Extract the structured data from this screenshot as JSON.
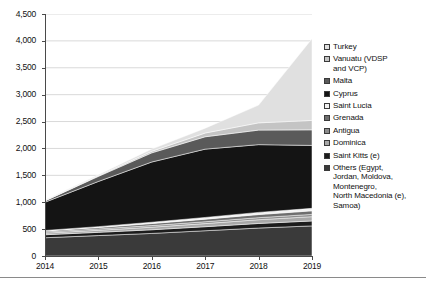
{
  "chart_data": {
    "type": "area",
    "stacked": true,
    "title": "",
    "xlabel": "",
    "ylabel": "",
    "x": [
      "2014",
      "2015",
      "2016",
      "2017",
      "2018",
      "2019"
    ],
    "categories": [
      "2014",
      "2015",
      "2016",
      "2017",
      "2018",
      "2019"
    ],
    "ylim": [
      0,
      4500
    ],
    "ytick_values": [
      0,
      500,
      1000,
      1500,
      2000,
      2500,
      3000,
      3500,
      4000,
      4500
    ],
    "ytick_labels": [
      "0",
      "500",
      "1,000",
      "1,500",
      "2,000",
      "2,500",
      "3,000",
      "3,500",
      "4,000",
      "4,500"
    ],
    "xtick_labels": [
      "2014",
      "2015",
      "2016",
      "2017",
      "2018",
      "2019"
    ],
    "grid": true,
    "grid_axis": "y",
    "legend_position": "right",
    "stack_order_bottom_to_top": [
      "Others (Egypt, Jordan, Moldova, Montenegro, North Macedonia (e), Samoa)",
      "Saint Kitts (e)",
      "Dominica",
      "Antigua",
      "Grenada",
      "Saint Lucia",
      "Cyprus",
      "Malta",
      "Vanuatu (VDSP and VCP)",
      "Turkey"
    ],
    "series": [
      {
        "name": "Others (Egypt, Jordan, Moldova, Montenegro, North Macedonia (e), Samoa)",
        "color": "#3a3a3a",
        "values": [
          340,
          380,
          420,
          470,
          520,
          560
        ]
      },
      {
        "name": "Saint Kitts (e)",
        "color": "#1c1c1c",
        "values": [
          55,
          60,
          68,
          75,
          85,
          92
        ]
      },
      {
        "name": "Dominica",
        "color": "#a8a8a8",
        "values": [
          30,
          38,
          48,
          58,
          70,
          80
        ]
      },
      {
        "name": "Antigua",
        "color": "#8c8c8c",
        "values": [
          22,
          26,
          30,
          34,
          38,
          42
        ]
      },
      {
        "name": "Grenada",
        "color": "#6e6e6e",
        "values": [
          18,
          26,
          38,
          48,
          58,
          66
        ]
      },
      {
        "name": "Saint Lucia",
        "color": "#f2f2f2",
        "values": [
          10,
          16,
          24,
          32,
          40,
          46
        ]
      },
      {
        "name": "Cyprus",
        "color": "#141414",
        "values": [
          525,
          840,
          1120,
          1270,
          1260,
          1170
        ]
      },
      {
        "name": "Malta",
        "color": "#5a5a5a",
        "values": [
          25,
          95,
          170,
          230,
          270,
          290
        ]
      },
      {
        "name": "Vanuatu (VDSP and VCP)",
        "color": "#c4c4c4",
        "values": [
          5,
          12,
          30,
          70,
          135,
          175
        ]
      },
      {
        "name": "Turkey",
        "color": "#e0e0e0",
        "values": [
          10,
          20,
          40,
          90,
          330,
          1520
        ]
      }
    ],
    "stack_totals": [
      1040,
      1513,
      1988,
      2337,
      2806,
      4041
    ],
    "axis_color": "#4a4a4a",
    "grid_color": "#d9d9d9",
    "background": "#ffffff"
  },
  "legend": {
    "items": [
      {
        "label": "Turkey",
        "color": "#e0e0e0"
      },
      {
        "label": "Vanuatu (VDSP\nand VCP)",
        "color": "#c4c4c4"
      },
      {
        "label": "Malta",
        "color": "#5a5a5a"
      },
      {
        "label": "Cyprus",
        "color": "#141414"
      },
      {
        "label": "Saint Lucia",
        "color": "#f2f2f2"
      },
      {
        "label": "Grenada",
        "color": "#6e6e6e"
      },
      {
        "label": "Antigua",
        "color": "#8c8c8c"
      },
      {
        "label": "Dominica",
        "color": "#a8a8a8"
      },
      {
        "label": "Saint Kitts (e)",
        "color": "#1c1c1c"
      },
      {
        "label": "Others (Egypt,\nJordan, Moldova,\nMontenegro,\nNorth Macedonia (e),\nSamoa)",
        "color": "#3a3a3a"
      }
    ]
  }
}
